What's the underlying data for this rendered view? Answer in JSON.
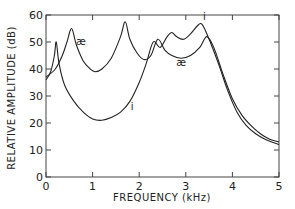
{
  "chart_data": {
    "type": "line",
    "title": "",
    "xlabel": "FREQUENCY (kHz)",
    "ylabel": "RELATIVE AMPLITUDE (dB)",
    "xlim": [
      0,
      5
    ],
    "ylim": [
      0,
      60
    ],
    "xticks": [
      0,
      1,
      2,
      3,
      4,
      5
    ],
    "yticks": [
      0,
      10,
      20,
      30,
      40,
      50,
      60
    ],
    "grid": false,
    "legend": "none",
    "series": [
      {
        "name": "i",
        "x": [
          0,
          0.1,
          0.18,
          0.22,
          0.28,
          0.4,
          0.6,
          0.8,
          1.0,
          1.2,
          1.4,
          1.6,
          1.8,
          2.0,
          2.15,
          2.3,
          2.45,
          2.6,
          2.7,
          2.8,
          2.95,
          3.1,
          3.25,
          3.35,
          3.5,
          3.7,
          3.9,
          4.1,
          4.3,
          4.5,
          4.7,
          5.0
        ],
        "values": [
          36,
          39,
          45,
          50,
          42,
          34,
          28,
          24,
          21.5,
          21,
          22,
          24,
          28,
          35,
          42,
          50,
          48,
          52,
          53.5,
          52,
          51,
          53,
          56,
          56.5,
          51,
          42,
          32,
          24,
          19,
          16,
          14,
          12
        ]
      },
      {
        "name": "æ",
        "x": [
          0,
          0.2,
          0.35,
          0.45,
          0.55,
          0.65,
          0.8,
          0.95,
          1.05,
          1.2,
          1.4,
          1.6,
          1.7,
          1.8,
          1.95,
          2.1,
          2.25,
          2.4,
          2.55,
          2.7,
          2.9,
          3.1,
          3.3,
          3.45,
          3.6,
          3.8,
          4.0,
          4.2,
          4.4,
          4.6,
          4.8,
          5.0
        ],
        "values": [
          37,
          40,
          45,
          50,
          55,
          49,
          43,
          40,
          39,
          40,
          44,
          52,
          57.5,
          51,
          46,
          43.5,
          45,
          51,
          47,
          45,
          44,
          45,
          48,
          52,
          48,
          38,
          29,
          23,
          19,
          16,
          14,
          13
        ]
      }
    ],
    "annotations": [
      {
        "text": "æ",
        "x": 0.75,
        "y": 49
      },
      {
        "text": "æ",
        "x": 2.9,
        "y": 41
      },
      {
        "text": "i",
        "x": 1.85,
        "y": 25
      },
      {
        "text": "i",
        "x": 3.4,
        "y": 58
      }
    ]
  }
}
